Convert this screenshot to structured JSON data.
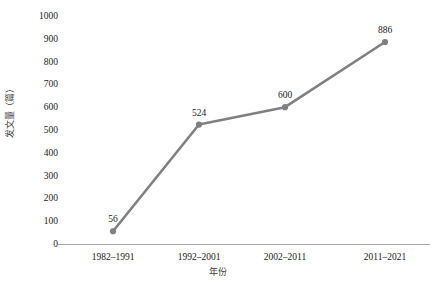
{
  "chart_data": {
    "type": "line",
    "title": "",
    "xlabel": "年份",
    "ylabel": "发文量（篇）",
    "categories": [
      "1982–1991",
      "1992–2001",
      "2002–2011",
      "2011–2021"
    ],
    "values": [
      56,
      524,
      600,
      886
    ],
    "point_labels": [
      "56",
      "524",
      "600",
      "886"
    ],
    "ylim": [
      0,
      1000
    ],
    "y_ticks": [
      0,
      100,
      200,
      300,
      400,
      500,
      600,
      700,
      800,
      900,
      1000
    ],
    "y_tick_labels": [
      "0",
      "100",
      "200",
      "300",
      "400",
      "500",
      "600",
      "700",
      "800",
      "900",
      "1000"
    ],
    "grid": false,
    "legend": false,
    "legend_position": "none",
    "series_color": "#808080",
    "marker": "circle",
    "axis_color": "#a6a6a6",
    "background_color": "#ffffff",
    "text_color": "#222222"
  }
}
